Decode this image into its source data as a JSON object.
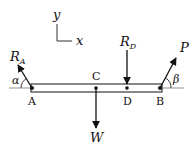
{
  "diagram": {
    "type": "free-body diagram",
    "axes": {
      "x_label": "x",
      "y_label": "y"
    },
    "points": [
      {
        "id": "A",
        "label": "A"
      },
      {
        "id": "C",
        "label": "C"
      },
      {
        "id": "D",
        "label": "D"
      },
      {
        "id": "B",
        "label": "B"
      }
    ],
    "forces": {
      "RA": {
        "label": "R",
        "subscript": "A",
        "direction": "up-left",
        "at": "A"
      },
      "RD": {
        "label": "R",
        "subscript": "D",
        "direction": "down",
        "at": "D"
      },
      "P": {
        "label": "P",
        "direction": "up-right",
        "at": "B"
      },
      "W": {
        "label": "W",
        "direction": "down",
        "at": "C"
      }
    },
    "angles": {
      "alpha": {
        "label": "α",
        "at": "A"
      },
      "beta": {
        "label": "β",
        "at": "B"
      }
    },
    "colors": {
      "ink": "#111111",
      "beam_fill": "#ffffff",
      "baseline": "#777777"
    }
  }
}
